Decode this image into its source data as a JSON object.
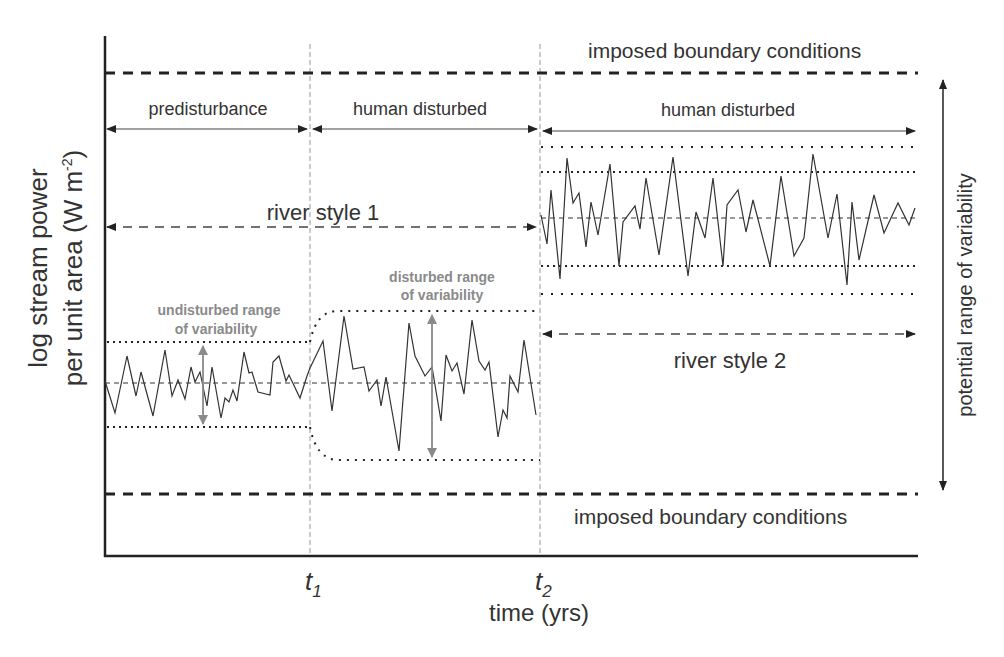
{
  "diagram": {
    "y_axis_label_line1": "log stream power",
    "y_axis_label_line2": "per unit area (W m",
    "y_axis_label_sup": "-2",
    "y_axis_label_close": ")",
    "x_axis_label": "time (yrs)",
    "ticks": [
      {
        "base": "t",
        "sub": "1"
      },
      {
        "base": "t",
        "sub": "2"
      }
    ],
    "boundary_top_label": "imposed boundary conditions",
    "boundary_bottom_label": "imposed boundary conditions",
    "phases": [
      {
        "label": "predisturbance"
      },
      {
        "label": "human disturbed"
      },
      {
        "label": "human disturbed"
      }
    ],
    "river_style_1": "river style 1",
    "river_style_2": "river style 2",
    "undisturbed_range_line1": "undisturbed range",
    "undisturbed_range_line2": "of variability",
    "disturbed_range_line1": "disturbed range",
    "disturbed_range_line2": "of variability",
    "potential_range": "potential range of variability",
    "colors": {
      "ink": "#222222",
      "text": "#333333",
      "annotation_grey": "#8a8a8a",
      "guide_grey": "#999999"
    }
  }
}
